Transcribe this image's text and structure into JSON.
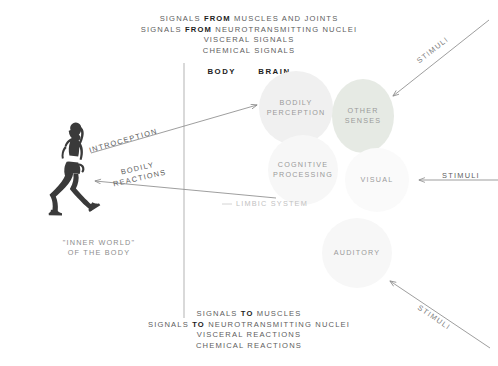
{
  "diagram": {
    "title_top_lines": [
      {
        "pre": "SIGNALS ",
        "strong": "FROM",
        "post": " MUSCLES AND JOINTS"
      },
      {
        "pre": "SIGNALS ",
        "strong": "FROM",
        "post": " NEUROTRANSMITTING NUCLEI"
      },
      {
        "pre": "VISCERAL SIGNALS",
        "strong": "",
        "post": ""
      },
      {
        "pre": "CHEMICAL SIGNALS",
        "strong": "",
        "post": ""
      }
    ],
    "title_bottom_lines": [
      {
        "pre": "SIGNALS ",
        "strong": "TO",
        "post": " MUSCLES"
      },
      {
        "pre": "SIGNALS ",
        "strong": "TO",
        "post": " NEUROTRANSMITTING NUCLEI"
      },
      {
        "pre": "VISCERAL REACTIONS",
        "strong": "",
        "post": ""
      },
      {
        "pre": "CHEMICAL REACTIONS",
        "strong": "",
        "post": ""
      }
    ],
    "divider": {
      "left_label": "BODY",
      "right_label": "BRAIN"
    },
    "circles": [
      {
        "id": "bodily-perception",
        "label": "BODILY\nPERCEPTION",
        "color": "#f0f0f0"
      },
      {
        "id": "other-senses",
        "label": "OTHER\nSENSES",
        "color": "#e6eae4"
      },
      {
        "id": "cognitive-processing",
        "label": "COGNITIVE\nPROCESSING",
        "color": "#f7f7f7"
      },
      {
        "id": "visual",
        "label": "VISUAL",
        "color": "#fafafa"
      },
      {
        "id": "auditory",
        "label": "AUDITORY",
        "color": "#f7f7f7"
      }
    ],
    "arrow_labels": {
      "introception": "INTROCEPTION",
      "bodily_reactions": "BODILY\nREACTIONS",
      "limbic_system": "LIMBIC SYSTEM"
    },
    "stimuli_labels": [
      "STIMULI",
      "STIMULI",
      "STIMULI"
    ],
    "inner_world": "\"INNER WORLD\"\nOF THE BODY",
    "colors": {
      "arrow": "#8c8c8c",
      "divider": "#9a9a9a",
      "text_dark": "#1d1d1d",
      "text_mid": "#5d5d5d",
      "text_light": "#b9b9b9",
      "silhouette": "#3a3a3a"
    }
  }
}
